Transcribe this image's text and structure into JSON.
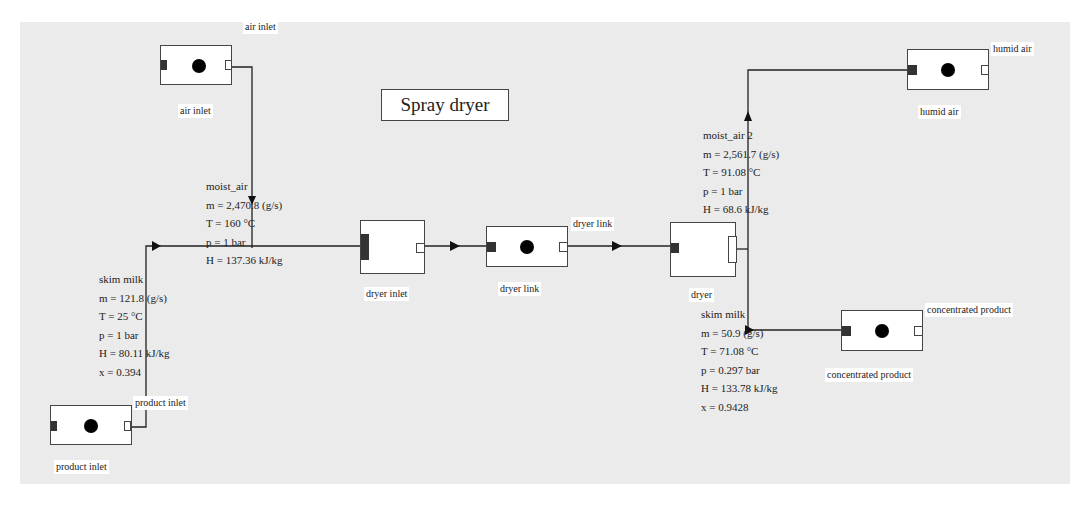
{
  "title": "Spray dryer",
  "blocks": {
    "air_inlet": {
      "top_label": "air inlet",
      "bottom_label": "air inlet"
    },
    "product_inlet": {
      "top_label": "product inlet",
      "bottom_label": "product inlet"
    },
    "dryer_inlet": {
      "bottom_label": "dryer inlet"
    },
    "dryer_link": {
      "top_label": "dryer link",
      "bottom_label": "dryer link"
    },
    "dryer": {
      "bottom_label": "dryer"
    },
    "humid_air": {
      "top_label": "humid air",
      "bottom_label": "humid air"
    },
    "concentrated_product": {
      "top_label": "concentrated product",
      "bottom_label": "concentrated product"
    }
  },
  "streams": {
    "moist_air": {
      "name": "moist_air",
      "m": "m = 2,470.8 (g/s)",
      "T": "T = 160 °C",
      "p": "p = 1 bar",
      "H": "H = 137.36 kJ/kg"
    },
    "skim_milk_in": {
      "name": "skim milk",
      "m": "m = 121.8 (g/s)",
      "T": "T = 25 °C",
      "p": "p = 1 bar",
      "H": "H = 80.11 kJ/kg",
      "x": "x = 0.394"
    },
    "moist_air_2": {
      "name": "moist_air 2",
      "m": "m = 2,561.7 (g/s)",
      "T": "T = 91.08 °C",
      "p": "p = 1 bar",
      "H": "H = 68.6 kJ/kg"
    },
    "skim_milk_out": {
      "name": "skim milk",
      "m": "m = 50.9 (g/s)",
      "T": "T = 71.08 °C",
      "p": "p = 0.297 bar",
      "H": "H = 133.78 kJ/kg",
      "x": "x = 0.9428"
    }
  }
}
